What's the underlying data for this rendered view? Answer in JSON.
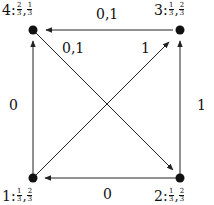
{
  "nodes": [
    {
      "id": "1",
      "label": "1:",
      "p1": {
        "num": "1",
        "den": "3"
      },
      "p2": {
        "num": "2",
        "den": "3"
      },
      "x": 33,
      "y": 178
    },
    {
      "id": "2",
      "label": "2:",
      "p1": {
        "num": "1",
        "den": "3"
      },
      "p2": {
        "num": "2",
        "den": "3"
      },
      "x": 180,
      "y": 178
    },
    {
      "id": "3",
      "label": "3:",
      "p1": {
        "num": "1",
        "den": "3"
      },
      "p2": {
        "num": "2",
        "den": "3"
      },
      "x": 180,
      "y": 30
    },
    {
      "id": "4",
      "label": "4:",
      "p1": {
        "num": "2",
        "den": "3"
      },
      "p2": {
        "num": "1",
        "den": "3"
      },
      "x": 33,
      "y": 30
    }
  ],
  "edges": [
    {
      "from": "3",
      "to": "4",
      "label": "0,1"
    },
    {
      "from": "4",
      "to": "2",
      "label": "0,1"
    },
    {
      "from": "1",
      "to": "4",
      "label": "0"
    },
    {
      "from": "1",
      "to": "3",
      "label": "1"
    },
    {
      "from": "2",
      "to": "3",
      "label": "1"
    },
    {
      "from": "2",
      "to": "1",
      "label": "0"
    }
  ],
  "colors": {
    "line": "#222222",
    "node": "#111111",
    "background": "#ffffff"
  }
}
